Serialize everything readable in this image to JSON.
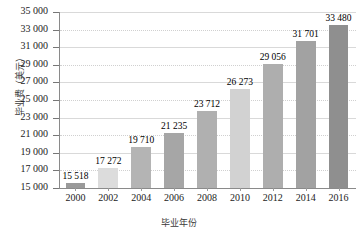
{
  "chart_data": {
    "type": "bar",
    "title": "",
    "xlabel": "毕业年份",
    "ylabel": "毕业费（美元）",
    "categories": [
      "2000",
      "2002",
      "2004",
      "2006",
      "2008",
      "2010",
      "2012",
      "2014",
      "2016"
    ],
    "values": [
      15518,
      17272,
      19710,
      21235,
      23712,
      26273,
      29056,
      31701,
      33480
    ],
    "value_labels": [
      "15 518",
      "17 272",
      "19 710",
      "21 235",
      "23 712",
      "26 273",
      "29 056",
      "31 701",
      "33 480"
    ],
    "ylim": [
      15000,
      35000
    ],
    "ytick_values": [
      15000,
      17000,
      19000,
      21000,
      23000,
      25000,
      27000,
      29000,
      31000,
      33000,
      35000
    ],
    "ytick_labels": [
      "15 000",
      "17 000",
      "19 000",
      "21 000",
      "23 000",
      "25 000",
      "27 000",
      "29 000",
      "31 000",
      "33 000",
      "35 000"
    ],
    "grid": true,
    "legend": "none",
    "bar_colors": [
      "#9a9a9a",
      "#dcdcdc",
      "#b4b4b4",
      "#a6a6a6",
      "#b0b0b0",
      "#d2d2d2",
      "#aeaeae",
      "#a2a2a2",
      "#8f8f8f"
    ],
    "axis_color": "#8a8a8a",
    "grid_color": "#d9d9d9",
    "background": "#ffffff"
  }
}
